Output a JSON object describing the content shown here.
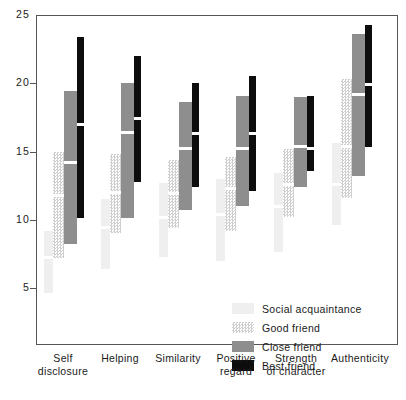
{
  "chart_data": {
    "type": "bar",
    "title": "",
    "xlabel": "",
    "ylabel": "",
    "ylim": [
      2.0,
      25.0
    ],
    "yticks": [
      5,
      10,
      15,
      20,
      25
    ],
    "ytick_labels": [
      "5",
      "10",
      "15",
      "20",
      "25"
    ],
    "grid": false,
    "legend_position": "inside-bottom-right",
    "note": "Floating range bars with a white median marker; each bar spans min-max for a relationship level.",
    "categories": [
      "Self disclosure",
      "Helping",
      "Similarity",
      "Positive regard",
      "Strength of character",
      "Authenticity"
    ],
    "category_lines": [
      [
        "Self",
        "disclosure"
      ],
      [
        "Helping",
        ""
      ],
      [
        "Similarity",
        ""
      ],
      [
        "Positive",
        "regard"
      ],
      [
        "Strength",
        "of character"
      ],
      [
        "Authenticity",
        ""
      ]
    ],
    "series": [
      {
        "name": "Social acquaintance",
        "color": "#efefef",
        "swatch": "sw-social",
        "ranges": [
          {
            "low": 4.6,
            "high": 9.2,
            "median": 7.2
          },
          {
            "low": 6.4,
            "high": 11.5,
            "median": 9.4
          },
          {
            "low": 7.3,
            "high": 12.7,
            "median": 10.2
          },
          {
            "low": 7.0,
            "high": 13.0,
            "median": 10.4
          },
          {
            "low": 7.6,
            "high": 13.4,
            "median": 11.0
          },
          {
            "low": 9.6,
            "high": 15.6,
            "median": 12.6
          }
        ]
      },
      {
        "name": "Good friend",
        "color": "#cfcfcf",
        "swatch": "sw-good",
        "ranges": [
          {
            "low": 7.2,
            "high": 15.0,
            "median": 11.8
          },
          {
            "low": 9.0,
            "high": 14.8,
            "median": 12.0
          },
          {
            "low": 9.4,
            "high": 14.4,
            "median": 11.9
          },
          {
            "low": 9.2,
            "high": 14.6,
            "median": 12.3
          },
          {
            "low": 10.2,
            "high": 15.2,
            "median": 12.6
          },
          {
            "low": 11.6,
            "high": 20.3,
            "median": 15.4
          }
        ]
      },
      {
        "name": "Close friend",
        "color": "#8e8e8e",
        "swatch": "sw-close",
        "ranges": [
          {
            "low": 8.2,
            "high": 19.4,
            "median": 14.2
          },
          {
            "low": 10.1,
            "high": 20.0,
            "median": 16.4
          },
          {
            "low": 10.7,
            "high": 18.6,
            "median": 15.2
          },
          {
            "low": 11.0,
            "high": 19.1,
            "median": 15.2
          },
          {
            "low": 12.4,
            "high": 19.0,
            "median": 15.4
          },
          {
            "low": 13.2,
            "high": 23.6,
            "median": 19.2
          }
        ]
      },
      {
        "name": "Best friend",
        "color": "#0d0d0d",
        "swatch": "sw-best",
        "ranges": [
          {
            "low": 10.1,
            "high": 23.4,
            "median": 17.0
          },
          {
            "low": 12.8,
            "high": 22.0,
            "median": 17.4
          },
          {
            "low": 12.4,
            "high": 20.0,
            "median": 16.3
          },
          {
            "low": 12.1,
            "high": 20.5,
            "median": 16.3
          },
          {
            "low": 13.6,
            "high": 19.1,
            "median": 15.2
          },
          {
            "low": 15.3,
            "high": 24.3,
            "median": 19.9
          }
        ]
      }
    ]
  },
  "legend": {
    "items": [
      {
        "label": "Social acquaintance",
        "swatch": "sw-social"
      },
      {
        "label": "Good friend",
        "swatch": "sw-good"
      },
      {
        "label": "Close friend",
        "swatch": "sw-close"
      },
      {
        "label": "Best friend",
        "swatch": "sw-best"
      }
    ]
  }
}
